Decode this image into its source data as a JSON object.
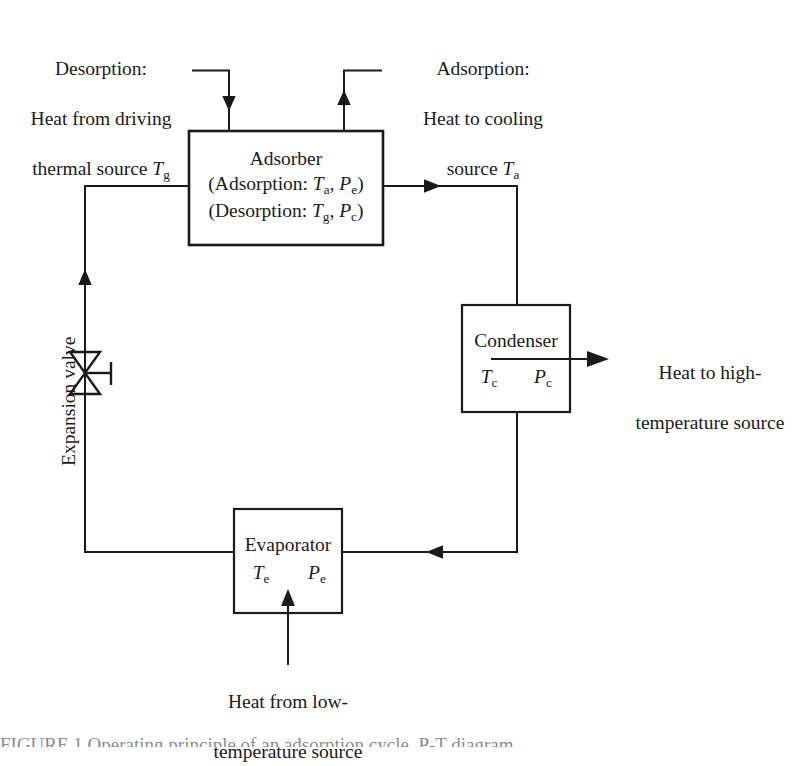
{
  "figure": {
    "type": "process-flow-diagram",
    "stroke_color": "#1a1a1a",
    "background_color": "#ffffff"
  },
  "labels": {
    "desorption_heat_in": {
      "line1": "Desorption:",
      "line2": "Heat from driving",
      "line3_pre": "thermal source ",
      "line3_sym": "T",
      "line3_sub": "g"
    },
    "adsorption_heat_out": {
      "line1": "Adsorption:",
      "line2": "Heat to cooling",
      "line3_pre": "source ",
      "line3_sym": "T",
      "line3_sub": "a"
    },
    "condenser_heat_out": {
      "line1": "Heat to high-",
      "line2": "temperature source"
    },
    "evaporator_heat_in": {
      "line1": "Heat from low-",
      "line2": "temperature source"
    },
    "expansion_valve": "Expansion valve"
  },
  "boxes": {
    "adsorber": {
      "name": "Adsorber",
      "line2_open": "(Adsorption: ",
      "line2_t": "T",
      "line2_t_sub": "a",
      "line2_mid": ", ",
      "line2_p": "P",
      "line2_p_sub": "e",
      "line2_close": ")",
      "line3_open": "(Desorption: ",
      "line3_t": "T",
      "line3_t_sub": "g",
      "line3_mid": ", ",
      "line3_p": "P",
      "line3_p_sub": "c",
      "line3_close": ")"
    },
    "condenser": {
      "name": "Condenser",
      "t_sym": "T",
      "t_sub": "c",
      "p_sym": "P",
      "p_sub": "c"
    },
    "evaporator": {
      "name": "Evaporator",
      "t_sym": "T",
      "t_sub": "e",
      "p_sym": "P",
      "p_sub": "e"
    }
  },
  "caption_fragment": "FIGURE 1  Operating principle of an adsorption cycle, P-T diagram"
}
